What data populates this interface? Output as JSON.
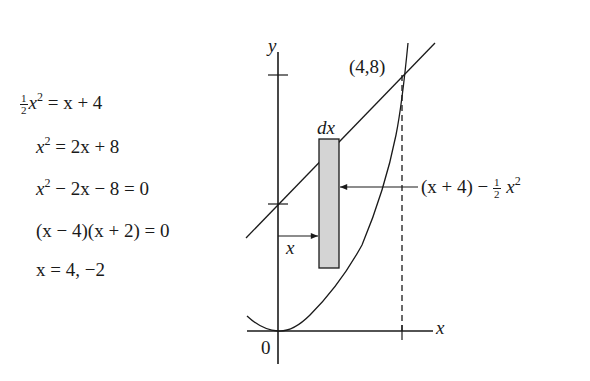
{
  "equations": [
    {
      "frac": {
        "num": "1",
        "den": "2"
      },
      "var": "x",
      "exp": "2",
      "rest": " = x + 4"
    },
    {
      "var": "x",
      "exp": "2",
      "rest": " = 2x + 8"
    },
    {
      "var": "x",
      "exp": "2",
      "rest": " − 2x − 8 = 0"
    },
    {
      "text": "(x − 4)(x + 2) = 0"
    },
    {
      "text": "x = 4, −2"
    }
  ],
  "graph": {
    "y_axis_label": "y",
    "x_axis_label": "x",
    "origin_label": "0",
    "intersection_label": "(4,8)",
    "strip_width_label": "dx",
    "strip_position_label": "x",
    "height_label": {
      "prefix": "(x + 4) − ",
      "frac_num": "1",
      "frac_den": "2",
      "var": "x",
      "exp": "2"
    },
    "curves": [
      {
        "name": "parabola",
        "equation": "y = x²/2"
      },
      {
        "name": "line",
        "equation": "y = x + 4"
      }
    ],
    "y_ticks": [
      4,
      8
    ],
    "x_ticks": [
      4
    ],
    "strip_fill": "#d4d4d4"
  }
}
